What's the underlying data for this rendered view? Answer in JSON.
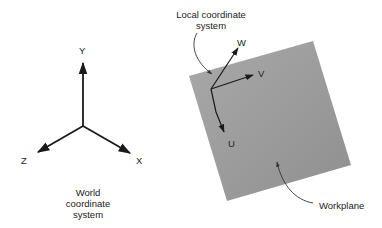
{
  "world": {
    "axes": {
      "y_label": "Y",
      "z_label": "Z",
      "x_label": "X"
    },
    "caption": {
      "line1": "World",
      "line2": "coordinate",
      "line3": "system"
    }
  },
  "local": {
    "caption": {
      "line1": "Local coordinate",
      "line2": "system"
    },
    "axes": {
      "w_label": "W",
      "v_label": "V",
      "u_label": "U"
    }
  },
  "workplane": {
    "label": "Workplane",
    "color": "#9e9e9e"
  },
  "colors": {
    "axis": "#1a1a1a",
    "background": "#ffffff",
    "text": "#222222"
  }
}
